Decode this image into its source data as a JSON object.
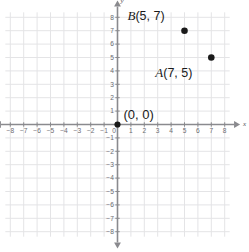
{
  "chart_data": {
    "type": "scatter",
    "title": "",
    "xlabel": "x",
    "ylabel": "y",
    "xlim": [
      -8.5,
      8.5
    ],
    "ylim": [
      -8.5,
      8.5
    ],
    "grid": true,
    "legend": "none",
    "xticks": [
      -8,
      -7,
      -6,
      -5,
      -4,
      -3,
      -2,
      -1,
      0,
      1,
      2,
      3,
      4,
      5,
      6,
      7,
      8
    ],
    "yticks": [
      8,
      7,
      6,
      5,
      4,
      3,
      2,
      1,
      -1,
      -2,
      -3,
      -4,
      -5,
      -6,
      -7,
      -8
    ],
    "xticklabels": [
      "-8",
      "-7",
      "-6",
      "-5",
      "-4",
      "-3",
      "-2",
      "-1",
      "0",
      "1",
      "2",
      "3",
      "4",
      "5",
      "6",
      "7",
      "8"
    ],
    "yticklabels": [
      "8",
      "7",
      "6",
      "5",
      "4",
      "3",
      "2",
      "1",
      "-1",
      "-2",
      "-3",
      "-4",
      "-5",
      "-6",
      "-7",
      "-8"
    ],
    "points": [
      {
        "name": "B",
        "x": 5,
        "y": 7,
        "label_var": "B",
        "label_coord": "(5, 7)"
      },
      {
        "name": "A",
        "x": 7,
        "y": 5,
        "label_var": "A",
        "label_coord": "(7, 5)"
      },
      {
        "name": "origin",
        "x": 0,
        "y": 0,
        "label_var": "",
        "label_coord": "(0, 0)"
      }
    ],
    "annotations": [
      {
        "text": "B (5, 7)",
        "x": 5,
        "y": 8
      },
      {
        "text": "A (7, 5)",
        "x": 6,
        "y": 4
      },
      {
        "text": "(0, 0)",
        "x": 1,
        "y": 1
      }
    ]
  },
  "axes": {
    "x_axis_name": "x",
    "y_axis_name": "y"
  },
  "colors": {
    "background": "#ffffff",
    "grid_line": "#e4e4e6",
    "axis_line": "#8a8a8e",
    "tick_text": "#6b6b70",
    "point_fill": "#1a1a1a",
    "label_text": "#1a1a1a"
  },
  "labels": {
    "point_b": {
      "var": "B",
      "coord": "(5, 7)"
    },
    "point_a": {
      "var": "A",
      "coord": "(7, 5)"
    },
    "origin": "(0, 0)"
  }
}
